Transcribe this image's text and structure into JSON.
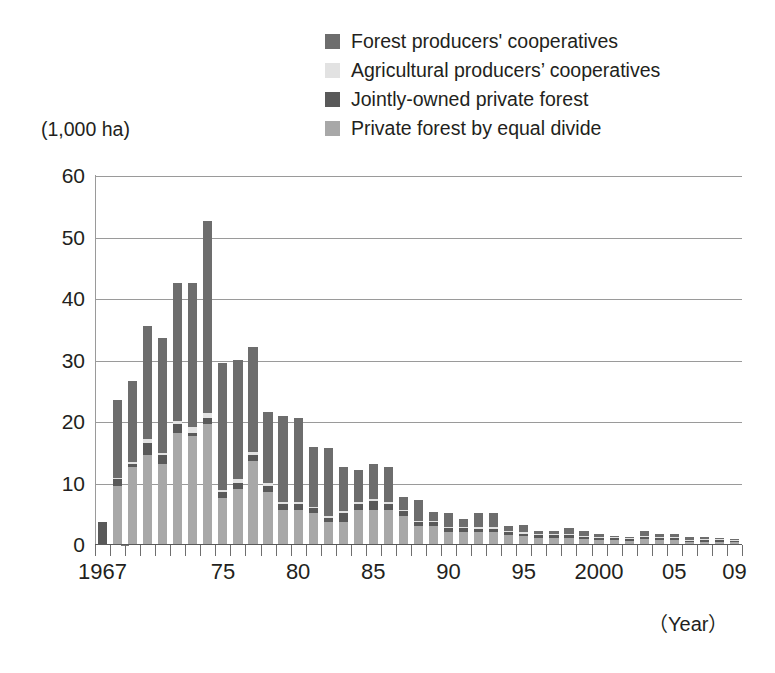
{
  "axis": {
    "y_unit_label": "(1,000 ha)",
    "x_unit_label": "（Year）",
    "y_ticks": [
      "60",
      "50",
      "40",
      "30",
      "20",
      "10",
      "0"
    ],
    "x_labels": [
      {
        "text": "1967",
        "year": 1967
      },
      {
        "text": "75",
        "year": 1975
      },
      {
        "text": "80",
        "year": 1980
      },
      {
        "text": "85",
        "year": 1985
      },
      {
        "text": "90",
        "year": 1990
      },
      {
        "text": "95",
        "year": 1995
      },
      {
        "text": "2000",
        "year": 2000
      },
      {
        "text": "05",
        "year": 2005
      },
      {
        "text": "09",
        "year": 2009
      }
    ]
  },
  "legend": {
    "items": [
      {
        "label": "Forest producers' cooperatives",
        "color": "#6d6d6d",
        "key": "forest_producers_cooperatives"
      },
      {
        "label": "Agricultural producers’ cooperatives",
        "color": "#e2e2e2",
        "key": "agricultural_producers_cooperatives"
      },
      {
        "label": "Jointly-owned private forest",
        "color": "#595959",
        "key": "jointly_owned_private_forest"
      },
      {
        "label": "Private forest by equal divide",
        "color": "#a8a8a8",
        "key": "private_forest_by_equal_divide"
      }
    ]
  },
  "chart_data": {
    "type": "bar",
    "stacked": true,
    "title": "",
    "subtitle": "",
    "xlabel": "（Year）",
    "ylabel": "(1,000 ha)",
    "ylim": [
      0,
      60
    ],
    "ytick_step": 10,
    "grid": true,
    "legend_position": "top-right",
    "categories": [
      1967,
      1968,
      1969,
      1970,
      1971,
      1972,
      1973,
      1974,
      1975,
      1976,
      1977,
      1978,
      1979,
      1980,
      1981,
      1982,
      1983,
      1984,
      1985,
      1986,
      1987,
      1988,
      1989,
      1990,
      1991,
      1992,
      1993,
      1994,
      1995,
      1996,
      1997,
      1998,
      1999,
      2000,
      2001,
      2002,
      2003,
      2004,
      2005,
      2006,
      2007,
      2008,
      2009
    ],
    "series": [
      {
        "name": "Private forest by equal divide",
        "color": "#a8a8a8",
        "values": [
          0.0,
          9.5,
          12.5,
          14.5,
          13.0,
          18.0,
          17.5,
          19.5,
          7.5,
          9.0,
          13.5,
          8.5,
          5.5,
          5.5,
          5.0,
          3.5,
          3.5,
          5.5,
          5.5,
          5.5,
          4.5,
          3.0,
          3.0,
          2.0,
          2.0,
          2.0,
          2.0,
          1.5,
          1.3,
          1.0,
          1.0,
          1.0,
          0.8,
          0.6,
          0.6,
          0.5,
          0.8,
          0.6,
          0.6,
          0.3,
          0.4,
          0.4,
          0.3
        ]
      },
      {
        "name": "Jointly-owned private forest",
        "color": "#595959",
        "values": [
          3.5,
          1.0,
          0.5,
          2.0,
          1.5,
          1.5,
          0.5,
          1.0,
          1.0,
          1.0,
          1.0,
          1.0,
          1.0,
          1.0,
          0.8,
          0.8,
          1.5,
          1.0,
          1.5,
          1.0,
          0.8,
          0.6,
          0.6,
          0.6,
          0.6,
          0.5,
          0.5,
          0.5,
          0.4,
          0.4,
          0.4,
          0.4,
          0.3,
          0.3,
          0.3,
          0.3,
          0.3,
          0.3,
          0.3,
          0.2,
          0.2,
          0.2,
          0.1
        ]
      },
      {
        "name": "Agricultural producers’ cooperatives",
        "color": "#e2e2e2",
        "values": [
          0.0,
          0.3,
          0.3,
          0.5,
          0.3,
          0.5,
          1.0,
          0.8,
          0.3,
          0.5,
          0.5,
          0.5,
          0.3,
          0.3,
          0.3,
          0.3,
          0.3,
          0.3,
          0.3,
          0.3,
          0.2,
          0.2,
          0.2,
          0.2,
          0.2,
          0.2,
          0.2,
          0.2,
          0.1,
          0.1,
          0.1,
          0.1,
          0.1,
          0.1,
          0.1,
          0.1,
          0.1,
          0.1,
          0.1,
          0.1,
          0.1,
          0.1,
          0.1
        ]
      },
      {
        "name": "Forest producers' cooperatives",
        "color": "#6d6d6d",
        "values": [
          0.0,
          12.7,
          13.2,
          18.5,
          18.7,
          22.5,
          23.5,
          31.2,
          20.7,
          19.5,
          17.0,
          11.5,
          14.0,
          13.7,
          9.7,
          11.0,
          7.2,
          5.2,
          5.7,
          5.7,
          2.2,
          3.4,
          1.4,
          2.2,
          1.2,
          2.3,
          2.3,
          0.8,
          1.2,
          0.5,
          0.5,
          1.1,
          0.8,
          0.5,
          0.1,
          0.2,
          0.8,
          0.5,
          0.6,
          0.4,
          0.4,
          0.1,
          0.1
        ]
      }
    ],
    "totals": [
      3.5,
      23.5,
      26.5,
      35.5,
      33.5,
      42.5,
      42.5,
      52.5,
      29.5,
      30.0,
      32.0,
      21.5,
      20.8,
      20.5,
      15.8,
      15.6,
      12.5,
      12.0,
      13.0,
      12.5,
      7.7,
      7.2,
      5.2,
      5.0,
      4.0,
      5.0,
      5.0,
      3.0,
      3.0,
      2.0,
      2.0,
      2.6,
      2.0,
      1.5,
      1.1,
      1.1,
      2.0,
      1.5,
      1.6,
      1.0,
      1.1,
      0.8,
      0.6
    ]
  }
}
